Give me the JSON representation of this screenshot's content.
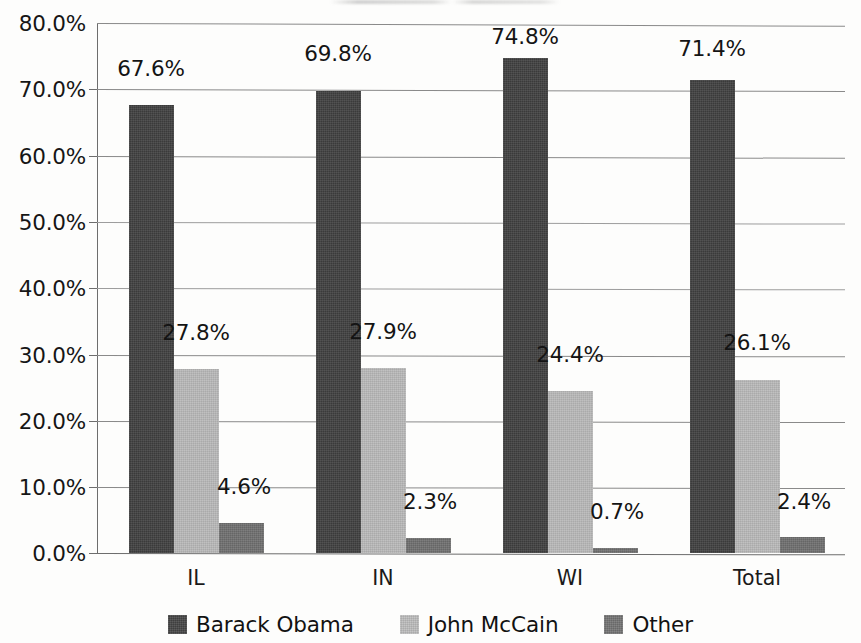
{
  "chart_data": {
    "type": "bar",
    "title": "",
    "subtitle": "",
    "xlabel": "",
    "ylabel": "",
    "categories": [
      "IL",
      "IN",
      "WI",
      "Total"
    ],
    "series": [
      {
        "name": "Barack Obama",
        "color": "#3f3f3f",
        "values": [
          67.6,
          69.8,
          74.8,
          71.4
        ],
        "labels": [
          "67.6%",
          "69.8%",
          "74.8%",
          "71.4%"
        ]
      },
      {
        "name": "John McCain",
        "color": "#b9b9b9",
        "values": [
          27.8,
          27.9,
          24.4,
          26.1
        ],
        "labels": [
          "27.8%",
          "27.9%",
          "24.4%",
          "26.1%"
        ]
      },
      {
        "name": "Other",
        "color": "#6f6f6f",
        "values": [
          4.6,
          2.3,
          0.7,
          2.4
        ],
        "labels": [
          "4.6%",
          "2.3%",
          "0.7%",
          "2.4%"
        ]
      }
    ],
    "ylim": [
      0,
      80
    ],
    "ytick_values": [
      0,
      10,
      20,
      30,
      40,
      50,
      60,
      70,
      80
    ],
    "ytick_labels": [
      "0.0%",
      "10.0%",
      "20.0%",
      "30.0%",
      "40.0%",
      "50.0%",
      "60.0%",
      "70.0%",
      "80.0%"
    ],
    "grid": true,
    "grid_axis": "y",
    "legend_position": "bottom",
    "value_labels_shown": true,
    "units": "percent"
  },
  "legend": {
    "items": [
      {
        "label": "Barack Obama",
        "swatch": "legend-swatch-dark-gray"
      },
      {
        "label": "John McCain",
        "swatch": "legend-swatch-light-gray"
      },
      {
        "label": "Other",
        "swatch": "legend-swatch-medium-gray"
      }
    ]
  }
}
